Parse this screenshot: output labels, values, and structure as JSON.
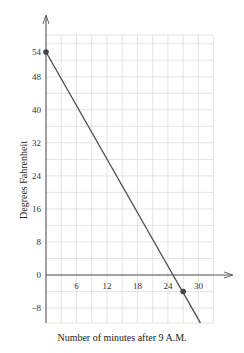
{
  "chart_data": {
    "type": "line",
    "title": "",
    "xlabel": "Number of minutes after 9 A.M.",
    "ylabel": "Degrees Fahrenheit",
    "x_ticks": [
      6,
      12,
      18,
      24,
      30
    ],
    "x_tick_labels": [
      "6",
      "12",
      "18",
      "24",
      "30"
    ],
    "y_ticks": [
      54,
      48,
      40,
      32,
      24,
      16,
      8,
      0,
      -8
    ],
    "y_tick_labels": [
      "54",
      "48",
      "40",
      "32",
      "24",
      "16",
      "8",
      "0",
      "−8"
    ],
    "xlim": [
      0,
      33
    ],
    "ylim": [
      -11.6,
      58
    ],
    "grid": true,
    "grid_x_step": 3,
    "grid_y_step": 4,
    "series": [
      {
        "name": "temperature",
        "x": [
          0,
          25,
          30.4
        ],
        "y": [
          54,
          0,
          -11.6
        ],
        "color": "#4a4a4a"
      }
    ],
    "highlighted_points": [
      {
        "x": 0,
        "y": 54
      },
      {
        "x": 27,
        "y": -4
      }
    ],
    "legend": null
  }
}
